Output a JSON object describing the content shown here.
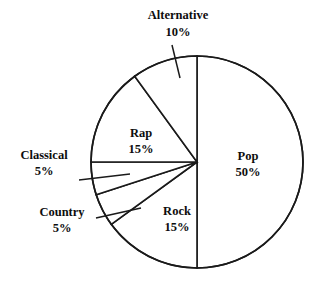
{
  "chart_data": {
    "type": "pie",
    "title": "",
    "subtitle": "",
    "xlabel": "",
    "ylabel": "",
    "legend_position": "none",
    "grid": false,
    "value_unit": "%",
    "total": 100,
    "categories": [
      "Pop",
      "Rock",
      "Country",
      "Classical",
      "Rap",
      "Alternative"
    ],
    "values": [
      50,
      15,
      5,
      5,
      15,
      10
    ],
    "slices": [
      {
        "label": "Pop",
        "percent_text": "50%",
        "value": 50,
        "start_angle_deg": 0,
        "end_angle_deg": 180,
        "label_placement": "inside",
        "label_x": 248,
        "label_y": 160,
        "pct_x": 248,
        "pct_y": 176
      },
      {
        "label": "Rock",
        "percent_text": "15%",
        "value": 15,
        "start_angle_deg": 180,
        "end_angle_deg": 234,
        "label_placement": "inside",
        "label_x": 177,
        "label_y": 215,
        "pct_x": 177,
        "pct_y": 231
      },
      {
        "label": "Country",
        "percent_text": "5%",
        "value": 5,
        "start_angle_deg": 234,
        "end_angle_deg": 252,
        "label_placement": "outside",
        "label_x": 62,
        "label_y": 216,
        "pct_x": 62,
        "pct_y": 232,
        "leader_x1": 96,
        "leader_y1": 218,
        "leader_x2": 141,
        "leader_y2": 208
      },
      {
        "label": "Classical",
        "percent_text": "5%",
        "value": 5,
        "start_angle_deg": 252,
        "end_angle_deg": 270,
        "label_placement": "outside",
        "label_x": 44,
        "label_y": 159,
        "pct_x": 44,
        "pct_y": 175,
        "leader_x1": 79,
        "leader_y1": 180,
        "leader_x2": 130,
        "leader_y2": 174
      },
      {
        "label": "Rap",
        "percent_text": "15%",
        "value": 15,
        "start_angle_deg": 270,
        "end_angle_deg": 324,
        "label_placement": "inside",
        "label_x": 141,
        "label_y": 137,
        "pct_x": 141,
        "pct_y": 153
      },
      {
        "label": "Alternative",
        "percent_text": "10%",
        "value": 10,
        "start_angle_deg": 324,
        "end_angle_deg": 360,
        "label_placement": "outside",
        "label_x": 178,
        "label_y": 19,
        "pct_x": 178,
        "pct_y": 36,
        "leader_x1": 172,
        "leader_y1": 45,
        "leader_x2": 180,
        "leader_y2": 78
      }
    ],
    "geometry": {
      "center_x": 197,
      "center_y": 162,
      "radius": 106
    },
    "colors": {
      "background": "#ffffff",
      "slice_fill": "#ffffff",
      "stroke": "#1a1a1a",
      "text": "#0d0d0d"
    }
  }
}
